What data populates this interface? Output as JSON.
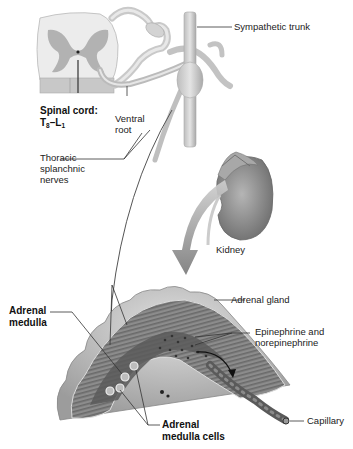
{
  "labels": {
    "sympathetic_trunk": "Sympathetic trunk",
    "spinal_cord_line1": "Spinal cord:",
    "spinal_cord_T": "T",
    "spinal_cord_T_sub": "8",
    "spinal_cord_dash": "–L",
    "spinal_cord_L_sub": "1",
    "ventral_root_line1": "Ventral",
    "ventral_root_line2": "root",
    "thoracic_line1": "Thoracic",
    "thoracic_line2": "splanchnic",
    "thoracic_line3": "nerves",
    "kidney": "Kidney",
    "adrenal_medulla_line1": "Adrenal",
    "adrenal_medulla_line2": "medulla",
    "adrenal_gland": "Adrenal gland",
    "epinephrine_line1": "Epinephrine and",
    "epinephrine_line2": "norepinephrine",
    "capillary": "Capillary",
    "adrenal_cells_line1": "Adrenal",
    "adrenal_cells_line2": "medulla cells"
  },
  "colors": {
    "tissue_light": "#d9d9d9",
    "tissue_mid": "#a6a6a6",
    "tissue_dark": "#6e6e6e",
    "gray_matter": "#9a9a9a",
    "leader_line": "#333333",
    "arrow": "#8a8a8a"
  }
}
